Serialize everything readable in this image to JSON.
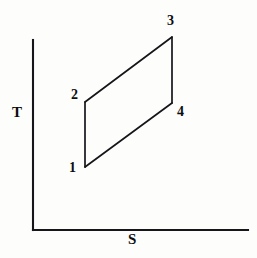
{
  "figure": {
    "name": "temperature-entropy-cycle-diagram",
    "background_color": "#fdfdfc",
    "line_color": "#16161a"
  },
  "axes": {
    "y_axis": {
      "label": "T",
      "name": "temperature-axis",
      "x": 33,
      "y_top": 40,
      "y_bottom": 230
    },
    "x_axis": {
      "label": "S",
      "name": "entropy-axis",
      "y": 230,
      "x_left": 33,
      "x_right": 248
    }
  },
  "state_points": [
    {
      "label": "1",
      "x": 85,
      "y": 167
    },
    {
      "label": "2",
      "x": 85,
      "y": 102
    },
    {
      "label": "3",
      "x": 172,
      "y": 37
    },
    {
      "label": "4",
      "x": 172,
      "y": 103
    }
  ],
  "chart_data": {
    "type": "line",
    "title": "",
    "xlabel": "S",
    "ylabel": "T",
    "grid": false,
    "legend": null,
    "axis_style": "open L-shaped axes, no tick marks, no numeric scale",
    "series": [
      {
        "name": "thermodynamic-cycle",
        "closed": true,
        "points": [
          {
            "state": "1",
            "x": 85,
            "y": 167
          },
          {
            "state": "2",
            "x": 85,
            "y": 102
          },
          {
            "state": "3",
            "x": 172,
            "y": 37
          },
          {
            "state": "4",
            "x": 172,
            "y": 103
          }
        ],
        "path": "1-2-3-4-1",
        "edges": [
          {
            "from": "1",
            "to": "2",
            "kind": "vertical-left"
          },
          {
            "from": "2",
            "to": "3",
            "kind": "slanted-top"
          },
          {
            "from": "3",
            "to": "4",
            "kind": "vertical-right"
          },
          {
            "from": "4",
            "to": "1",
            "kind": "slanted-bottom"
          }
        ]
      }
    ],
    "annotations": [
      {
        "text": "1",
        "x": 76,
        "y": 168
      },
      {
        "text": "2",
        "x": 77,
        "y": 95
      },
      {
        "text": "3",
        "x": 173,
        "y": 21
      },
      {
        "text": "4",
        "x": 183,
        "y": 112
      }
    ]
  }
}
